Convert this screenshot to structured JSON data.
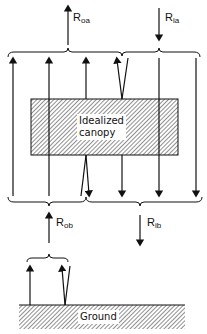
{
  "figure": {
    "canopy_label_line1": "Idealized",
    "canopy_label_line2": "canopy",
    "ground_label": "Ground",
    "fluxes": {
      "R_oa": {
        "symbol": "R",
        "subscript": "oa",
        "direction": "up"
      },
      "R_ia": {
        "symbol": "R",
        "subscript": "ia",
        "direction": "down"
      },
      "R_ob": {
        "symbol": "R",
        "subscript": "ob",
        "direction": "up"
      },
      "R_ib": {
        "symbol": "R",
        "subscript": "ib",
        "direction": "down"
      }
    },
    "colors": {
      "line": "#111111",
      "background": "#ffffff"
    }
  }
}
